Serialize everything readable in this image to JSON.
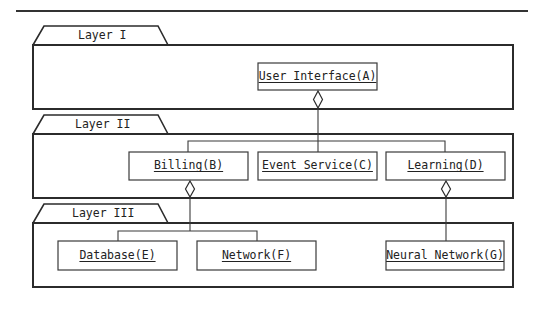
{
  "diagram": {
    "type": "layered-component-diagram",
    "layers": [
      {
        "id": "layer-1",
        "label": "Layer I",
        "components": [
          {
            "id": "A",
            "label": "User Interface(A)"
          }
        ]
      },
      {
        "id": "layer-2",
        "label": "Layer II",
        "components": [
          {
            "id": "B",
            "label": "Billing(B)"
          },
          {
            "id": "C",
            "label": "Event Service(C)"
          },
          {
            "id": "D",
            "label": "Learning(D)"
          }
        ]
      },
      {
        "id": "layer-3",
        "label": "Layer III",
        "components": [
          {
            "id": "E",
            "label": "Database(E)"
          },
          {
            "id": "F",
            "label": "Network(F)"
          },
          {
            "id": "G",
            "label": "Neural Network(G)"
          }
        ]
      }
    ],
    "relations": [
      {
        "type": "aggregation",
        "whole": "A",
        "parts": [
          "B",
          "C",
          "D"
        ]
      },
      {
        "type": "aggregation",
        "whole": "B",
        "parts": [
          "E",
          "F"
        ]
      },
      {
        "type": "aggregation",
        "whole": "D",
        "parts": [
          "G"
        ]
      }
    ],
    "colors": {
      "line": "#2b2b2b",
      "background": "#ffffff",
      "text": "#222222"
    }
  }
}
